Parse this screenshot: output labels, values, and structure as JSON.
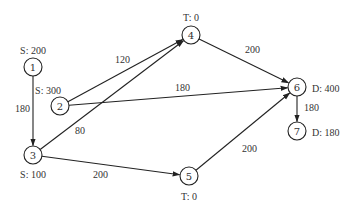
{
  "diagram": {
    "nodes": [
      {
        "id": "1",
        "label": "1",
        "x": 33,
        "y": 67,
        "annotation": "S: 200",
        "ax": 33,
        "ay": 50,
        "anchor": "middle"
      },
      {
        "id": "2",
        "label": "2",
        "x": 60,
        "y": 106,
        "annotation": "S: 300",
        "ax": 48,
        "ay": 90,
        "anchor": "middle"
      },
      {
        "id": "3",
        "label": "3",
        "x": 33,
        "y": 155,
        "annotation": "S: 100",
        "ax": 33,
        "ay": 174,
        "anchor": "middle"
      },
      {
        "id": "4",
        "label": "4",
        "x": 191,
        "y": 35,
        "annotation": "T: 0",
        "ax": 191,
        "ay": 17,
        "anchor": "middle"
      },
      {
        "id": "5",
        "label": "5",
        "x": 189,
        "y": 176,
        "annotation": "T: 0",
        "ax": 189,
        "ay": 196,
        "anchor": "middle"
      },
      {
        "id": "6",
        "label": "6",
        "x": 297,
        "y": 87,
        "annotation": "D: 400",
        "ax": 312,
        "ay": 88,
        "anchor": "start"
      },
      {
        "id": "7",
        "label": "7",
        "x": 297,
        "y": 131,
        "annotation": "D: 180",
        "ax": 312,
        "ay": 132,
        "anchor": "start"
      }
    ],
    "edges": [
      {
        "from": "1",
        "to": "3",
        "label": "180",
        "lx": 15,
        "ly": 112
      },
      {
        "from": "2",
        "to": "4",
        "label": "120",
        "lx": 115,
        "ly": 63
      },
      {
        "from": "2",
        "to": "6",
        "label": "180",
        "lx": 175,
        "ly": 91
      },
      {
        "from": "3",
        "to": "4",
        "label": "80",
        "lx": 75,
        "ly": 134
      },
      {
        "from": "3",
        "to": "5",
        "label": "200",
        "lx": 93,
        "ly": 178
      },
      {
        "from": "4",
        "to": "6",
        "label": "200",
        "lx": 245,
        "ly": 53
      },
      {
        "from": "5",
        "to": "6",
        "label": "200",
        "lx": 242,
        "ly": 152
      },
      {
        "from": "6",
        "to": "7",
        "label": "180",
        "lx": 304,
        "ly": 111
      }
    ]
  }
}
